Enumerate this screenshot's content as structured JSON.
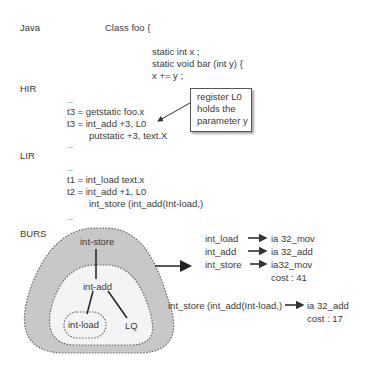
{
  "sections": {
    "java": {
      "label": "Java",
      "class_decl": "Class foo {",
      "lines": [
        "static int x ;",
        "static void bar (int y) {",
        "x += y ;"
      ]
    },
    "hir": {
      "label": "HIR",
      "lines": [
        "...",
        "t3 = getstatic foo.x",
        "t3 = int_add +3, L0",
        "putstatic +3, text.X",
        "..."
      ],
      "callout": [
        "register L0",
        "holds the",
        "parameter y"
      ]
    },
    "lir": {
      "label": "LIR",
      "lines": [
        "...",
        "t1 = int_load text.x",
        "t2 = int_add +1, L0",
        "int_store (int_add(Int-load,)",
        "..."
      ]
    },
    "burs": {
      "label": "BURS",
      "tree": {
        "outer": "int-store",
        "middle": "int-add",
        "inner": "int-load",
        "leaf": "LQ"
      },
      "mapping1": {
        "rows": [
          {
            "from": "int_load",
            "to": "ia 32_mov"
          },
          {
            "from": "int_add",
            "to": "ia 32_add"
          },
          {
            "from": "int_store",
            "to": "ia32_mov"
          }
        ],
        "cost": "cost : 41"
      },
      "mapping2": {
        "from": "int_store (int_add(Int-load,)",
        "to": "ia 32_add",
        "cost": "cost : 17"
      }
    }
  },
  "colors": {
    "outer_region": "#c8c8c8",
    "middle_region": "#f4f4f4",
    "text": "#3a3a3a"
  }
}
